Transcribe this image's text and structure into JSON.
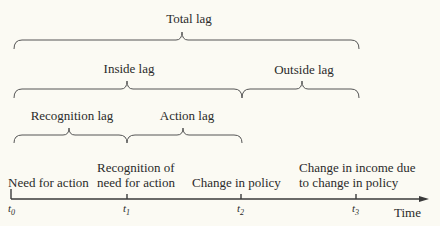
{
  "diagram": {
    "brackets": {
      "total": "Total lag",
      "inside": "Inside lag",
      "outside": "Outside lag",
      "recognition": "Recognition lag",
      "action": "Action lag"
    },
    "events": {
      "t0": "Need for action",
      "t1_line1": "Recognition of",
      "t1_line2": "need for action",
      "t2": "Change in policy",
      "t3_line1": "Change in income due",
      "t3_line2": "to change in policy"
    },
    "ticks": {
      "t0": "0",
      "t1": "1",
      "t2": "2",
      "t3": "3"
    },
    "axis_label": "Time",
    "line_color": "#3a3a3a"
  }
}
